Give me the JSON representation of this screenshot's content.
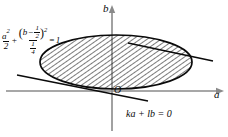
{
  "figure": {
    "type": "math-diagram",
    "axes": {
      "horizontal_label": "a",
      "vertical_label": "b",
      "origin_label": "O"
    },
    "ellipse_equation": {
      "term1_numerator": "a",
      "term1_numerator_exponent": "2",
      "term1_denominator": "2",
      "plus": "+",
      "term2_inner_variable": "b",
      "term2_inner_minus": "−",
      "term2_inner_frac_num": "1",
      "term2_inner_frac_den": "2",
      "term2_exponent": "2",
      "term2_denominator_num": "1",
      "term2_denominator_den": "4",
      "equals": "=",
      "right_hand_side": "1",
      "open_paren": "(",
      "close_paren": ")"
    },
    "line_label": "ka + lb = 0",
    "colors": {
      "stroke": "#0a0a0a",
      "axis": "#6b6b6b",
      "hatch": "#1a1a1a",
      "background": "#ffffff"
    }
  }
}
